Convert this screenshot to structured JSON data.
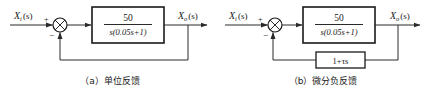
{
  "diagrams": [
    {
      "id": "a",
      "caption": "（a）单位反馈",
      "input_label": {
        "var": "X",
        "sub": "i",
        "arg": "(s)"
      },
      "output_label": {
        "var": "X",
        "sub": "o",
        "arg": "(s)"
      },
      "sum_signs": {
        "plus": "+",
        "minus": "−"
      },
      "forward_block": {
        "numerator": "50",
        "denominator": "s(0.05s+1)"
      },
      "feedback_block": null
    },
    {
      "id": "b",
      "caption": "（b）微分负反馈",
      "input_label": {
        "var": "X",
        "sub": "i",
        "arg": "(s)"
      },
      "output_label": {
        "var": "X",
        "sub": "o",
        "arg": "(s)"
      },
      "sum_signs": {
        "plus": "+",
        "minus": "−"
      },
      "forward_block": {
        "numerator": "50",
        "denominator": "s(0.05s+1)"
      },
      "feedback_block": {
        "expression": "1+τs"
      }
    }
  ],
  "colors": {
    "line": "#2a2a2a",
    "background": "#ffffff"
  }
}
